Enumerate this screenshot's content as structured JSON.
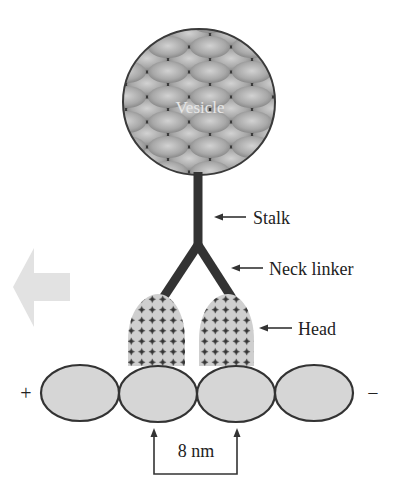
{
  "diagram": {
    "vesicle": {
      "label": "Vesicle"
    },
    "labels": {
      "stalk": "Stalk",
      "neck_linker": "Neck linker",
      "head": "Head"
    },
    "microtubule": {
      "plus_end": "+",
      "minus_end": "−",
      "step_size": "8 nm"
    },
    "direction_arrow": "toward plus end",
    "colors": {
      "vesicle_dark": "#3a3a3a",
      "vesicle_light": "#b8b8b8",
      "stalk": "#333333",
      "head_fill": "#cfcfcf",
      "tubulin_fill": "#d6d6d6",
      "arrow_fill": "#e2e2e2"
    }
  }
}
